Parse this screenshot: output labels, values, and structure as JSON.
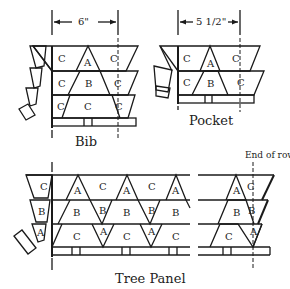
{
  "diagram": {
    "type": "quilt block assembly diagram",
    "bib": {
      "caption": "Bib",
      "dimension": "6\"",
      "rows": [
        [
          "C",
          "A",
          "C"
        ],
        [
          "C",
          "B",
          "C"
        ],
        [
          "C",
          "C",
          "C"
        ]
      ]
    },
    "pocket": {
      "caption": "Pocket",
      "dimension": "5 1/2\"",
      "rows": [
        [
          "C",
          "A",
          "C"
        ],
        [
          "C",
          "B",
          "C"
        ]
      ]
    },
    "tree_panel": {
      "caption": "Tree Panel",
      "annotation": "End of row",
      "side_pieces": [
        "C",
        "B",
        "A"
      ],
      "rows": [
        [
          "C",
          "A",
          "C",
          "A",
          "C",
          "A",
          "A",
          "C"
        ],
        [
          "B",
          "B",
          "B",
          "B",
          "B",
          "B",
          "B",
          "B"
        ],
        [
          "A",
          "C",
          "A",
          "C",
          "A",
          "C",
          "C",
          "A"
        ]
      ],
      "left_edge_labels": [
        "C",
        "B",
        "A"
      ],
      "main_row1": [
        "A",
        "C",
        "A",
        "C",
        "A"
      ],
      "main_row2": [
        "B",
        "B",
        "B",
        "B",
        "B"
      ],
      "main_row3": [
        "C",
        "A",
        "C",
        "A",
        "C"
      ],
      "end_row1": [
        "A",
        "C"
      ],
      "end_row2": [
        "B",
        "B"
      ],
      "end_row3": [
        "C",
        "A"
      ]
    }
  }
}
